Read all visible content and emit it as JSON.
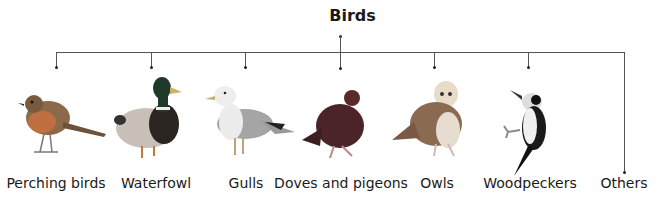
{
  "title": "Birds",
  "categories": [
    {
      "label": "Perching birds",
      "x": 56,
      "icon": "robin-icon"
    },
    {
      "label": "Waterfowl",
      "x": 151,
      "icon": "duck-icon"
    },
    {
      "label": "Gulls",
      "x": 245,
      "icon": "gull-icon"
    },
    {
      "label": "Doves and pigeons",
      "x": 340,
      "icon": "pigeon-icon"
    },
    {
      "label": "Owls",
      "x": 434,
      "icon": "owl-icon"
    },
    {
      "label": "Woodpeckers",
      "x": 528,
      "icon": "woodpecker-icon"
    },
    {
      "label": "Others",
      "x": 624,
      "icon": ""
    }
  ]
}
